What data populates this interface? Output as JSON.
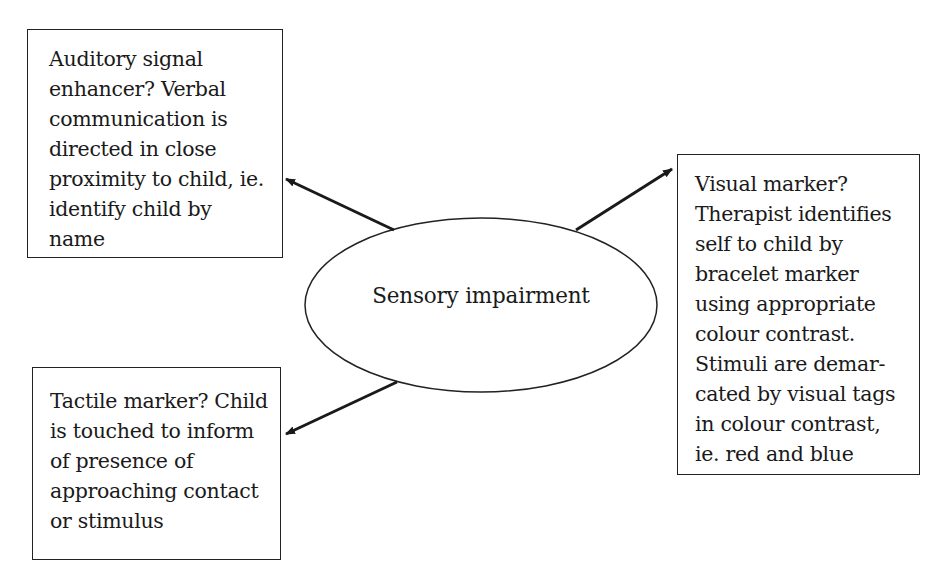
{
  "diagram": {
    "center": {
      "label": "Sensory impairment",
      "shape": "ellipse"
    },
    "nodes": [
      {
        "id": "auditory",
        "position": "top-left",
        "lines": [
          "Auditory signal",
          "enhancer? Verbal",
          "communication is",
          "directed in close",
          "proximity to child, ie.",
          "identify child by",
          "name"
        ]
      },
      {
        "id": "visual",
        "position": "right",
        "lines": [
          "Visual marker?",
          "Therapist identifies",
          "self to child by",
          "bracelet marker",
          "using appropriate",
          "colour contrast.",
          "Stimuli are demar-",
          "cated by visual tags",
          "in colour contrast,",
          "ie. red and blue"
        ]
      },
      {
        "id": "tactile",
        "position": "bottom-left",
        "lines": [
          "Tactile marker? Child",
          "is touched to inform",
          "of presence of",
          "approaching contact",
          "or stimulus"
        ]
      }
    ],
    "edges": [
      {
        "from": "center",
        "to": "auditory",
        "type": "arrow"
      },
      {
        "from": "center",
        "to": "visual",
        "type": "arrow"
      },
      {
        "from": "center",
        "to": "tactile",
        "type": "arrow"
      }
    ],
    "colors": {
      "stroke": "#222222",
      "background": "#ffffff",
      "text": "#1a1a1a"
    }
  }
}
